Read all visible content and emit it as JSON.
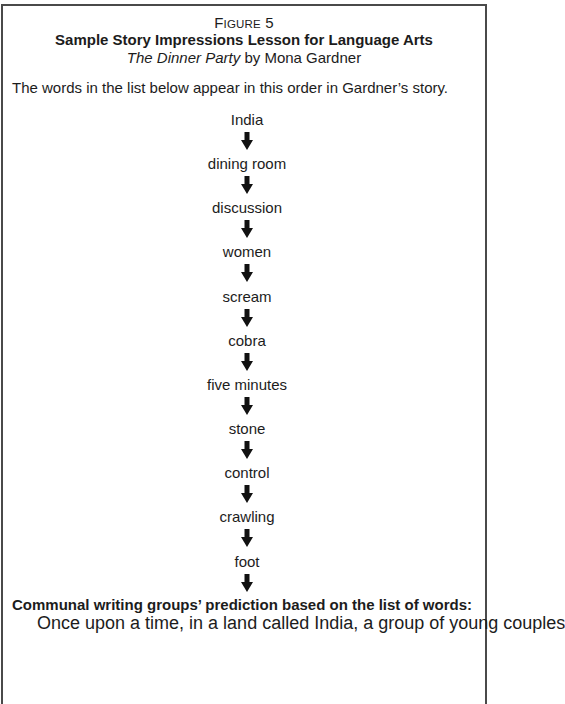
{
  "figure": {
    "label_prefix": "F",
    "label_smallcaps": "IGURE",
    "label_number": " 5",
    "title": "Sample Story Impressions Lesson for Language Arts",
    "subtitle_italic": "The Dinner Party",
    "subtitle_rest": " by Mona Gardner"
  },
  "intro": "The words in the list below appear in this order in Gardner’s story.",
  "word_chain": {
    "arrow_icon": "down-arrow",
    "words": [
      "India",
      "dining room",
      "discussion",
      "women",
      "scream",
      "cobra",
      "five minutes",
      "stone",
      "control",
      "crawling",
      "foot"
    ]
  },
  "prediction": {
    "heading": "Communal writing groups’ prediction based on the list of words:",
    "text": "Once upon a time, in a land called India, a group of young couples"
  },
  "colors": {
    "border": "#4a4a4a",
    "text": "#1c1c1c",
    "background": "#ffffff"
  }
}
